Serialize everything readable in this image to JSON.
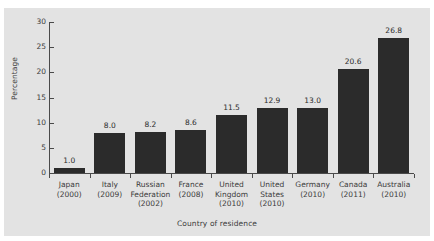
{
  "figure": {
    "background_color": "#ffffff",
    "panel_color": "#e3e3e3",
    "bar_color": "#2b2b2b",
    "axis_color": "#4a4a4a",
    "text_color": "#3b3b3b"
  },
  "chart_data": {
    "type": "bar",
    "title": "",
    "subtitle": "",
    "xlabel": "Country of residence",
    "ylabel": "Percentage",
    "categories": [
      "Japan\n(2000)",
      "Italy\n(2009)",
      "Russian\nFederation\n(2002)",
      "France\n(2008)",
      "United\nKingdom\n(2010)",
      "United\nStates\n(2010)",
      "Germany\n(2010)",
      "Canada\n(2011)",
      "Australia\n(2010)"
    ],
    "category_lines": [
      [
        "Japan",
        "(2000)"
      ],
      [
        "Italy",
        "(2009)"
      ],
      [
        "Russian",
        "Federation",
        "(2002)"
      ],
      [
        "France",
        "(2008)"
      ],
      [
        "United",
        "Kingdom",
        "(2010)"
      ],
      [
        "United",
        "States",
        "(2010)"
      ],
      [
        "Germany",
        "(2010)"
      ],
      [
        "Canada",
        "(2011)"
      ],
      [
        "Australia",
        "(2010)"
      ]
    ],
    "values": [
      1.0,
      8.0,
      8.2,
      8.6,
      11.5,
      12.9,
      13.0,
      20.6,
      26.8
    ],
    "data_labels": [
      "1.0",
      "8.0",
      "8.2",
      "8.6",
      "11.5",
      "12.9",
      "13.0",
      "20.6",
      "26.8"
    ],
    "ylim": [
      0,
      30
    ],
    "yticks": [
      0,
      5,
      10,
      15,
      20,
      25,
      30
    ],
    "ytick_labels": [
      "0",
      "5",
      "10",
      "15",
      "20",
      "25",
      "30"
    ],
    "grid": false,
    "legend": null
  }
}
